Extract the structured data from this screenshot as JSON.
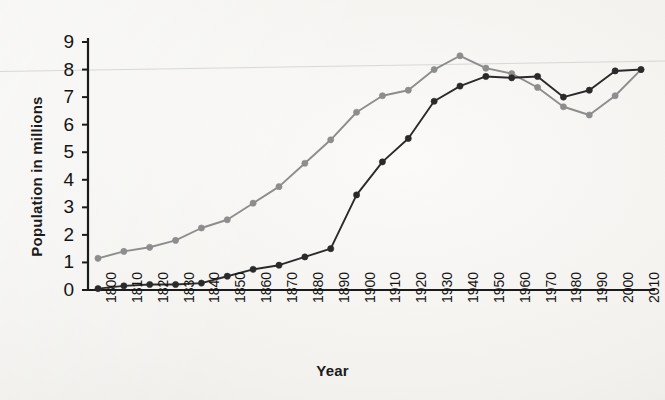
{
  "chart_data": {
    "type": "line",
    "title": "",
    "xlabel": "Year",
    "ylabel": "Population in millions",
    "x": [
      1800,
      1810,
      1820,
      1830,
      1840,
      1850,
      1860,
      1870,
      1880,
      1890,
      1900,
      1910,
      1920,
      1930,
      1940,
      1950,
      1960,
      1970,
      1980,
      1990,
      2000,
      2010
    ],
    "categories": [
      "1800",
      "1810",
      "1820",
      "1830",
      "1840",
      "1850",
      "1860",
      "1870",
      "1880",
      "1890",
      "1900",
      "1910",
      "1920",
      "1930",
      "1940",
      "1950",
      "1960",
      "1970",
      "1980",
      "1990",
      "2000",
      "2010"
    ],
    "xlim": [
      1800,
      2010
    ],
    "ylim": [
      0,
      9
    ],
    "yticks": [
      0,
      1,
      2,
      3,
      4,
      5,
      6,
      7,
      8,
      9
    ],
    "ytick_labels": [
      "0",
      "1",
      "2",
      "3",
      "4",
      "5",
      "6",
      "7",
      "8",
      "9"
    ],
    "grid": false,
    "legend": "none",
    "series": [
      {
        "name": "series-gray",
        "color": "#8d8d8d",
        "marker": "circle",
        "values": [
          1.15,
          1.4,
          1.55,
          1.8,
          2.25,
          2.55,
          3.15,
          3.75,
          4.6,
          5.45,
          6.45,
          7.05,
          7.25,
          8.0,
          8.5,
          8.05,
          7.85,
          7.35,
          6.65,
          6.35,
          7.05,
          8.0
        ]
      },
      {
        "name": "series-dark",
        "color": "#2a2a2a",
        "marker": "circle",
        "values": [
          0.05,
          0.15,
          0.2,
          0.2,
          0.25,
          0.5,
          0.75,
          0.9,
          1.2,
          1.5,
          3.45,
          4.65,
          5.5,
          6.85,
          7.4,
          7.75,
          7.7,
          7.75,
          7.0,
          7.25,
          7.95,
          8.0
        ]
      }
    ]
  },
  "axis": {
    "y_title": "Population in millions",
    "x_title": "Year"
  }
}
